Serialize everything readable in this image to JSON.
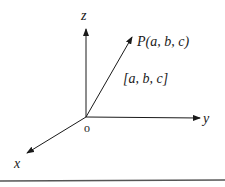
{
  "diagram": {
    "type": "3d-coordinate-axes",
    "axes": {
      "z": {
        "label": "z"
      },
      "y": {
        "label": "y"
      },
      "x": {
        "label": "x"
      }
    },
    "origin": {
      "label": "o"
    },
    "point": {
      "label": "P(a, b, c)"
    },
    "vector": {
      "label": "[a, b, c]"
    },
    "colors": {
      "stroke": "#1a1a1a",
      "background": "#ffffff"
    }
  }
}
